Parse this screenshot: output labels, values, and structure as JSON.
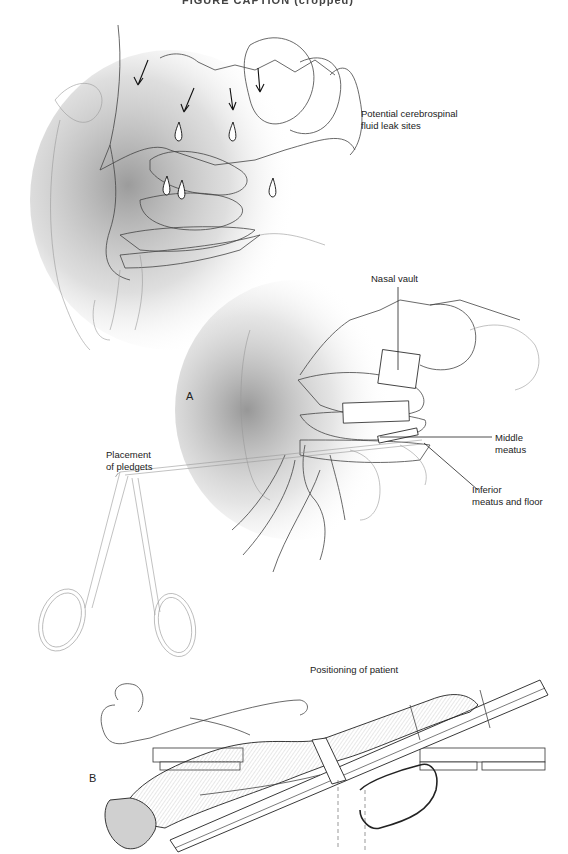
{
  "page": {
    "header_partial": "FIGURE CAPTION (cropped)",
    "background": "#ffffff"
  },
  "figure": {
    "panel_a": {
      "letter": "A",
      "labels": {
        "csf_leak": "Potential cerebrospinal\nfluid leak sites",
        "nasal_vault": "Nasal vault",
        "middle_meatus": "Middle\nmeatus",
        "pledgets": "Placement\nof pledgets",
        "inferior_meatus": "Inferior\nmeatus and floor"
      },
      "leak_arrow_count": 4,
      "leak_drop_count": 5
    },
    "panel_b": {
      "letter": "B",
      "labels": {
        "positioning": "Positioning of patient"
      }
    }
  }
}
